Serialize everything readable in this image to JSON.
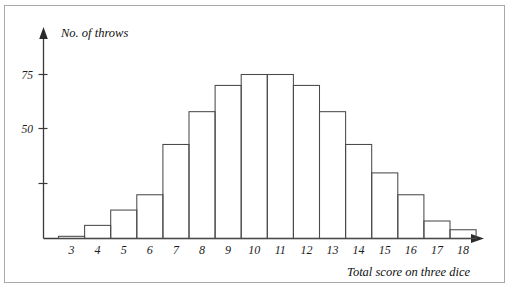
{
  "chart_data": {
    "type": "bar",
    "title": "",
    "ylabel": "No. of throws",
    "xlabel": "Total score on three dice",
    "categories": [
      "3",
      "4",
      "5",
      "6",
      "7",
      "8",
      "9",
      "10",
      "11",
      "12",
      "13",
      "14",
      "15",
      "16",
      "17",
      "18"
    ],
    "values": [
      1,
      6,
      13,
      20,
      43,
      58,
      70,
      75,
      75,
      70,
      58,
      43,
      30,
      20,
      8,
      4
    ],
    "ylim": [
      0,
      92
    ],
    "xlim": [
      2.5,
      18.5
    ],
    "y_ticks": [
      25,
      50,
      75
    ],
    "y_tick_labels": [
      "",
      "50",
      "75"
    ],
    "grid": false,
    "legend": false,
    "bar_style": "outline",
    "colors": {
      "bar_stroke": "#4a4a4a",
      "bar_fill": "none",
      "axis": "#3a3a3a",
      "text": "#1c1c1c",
      "frame": "#a8a8a8",
      "background": "#ffffff"
    }
  },
  "axes": {
    "y_axis_name": "No. of throws",
    "x_axis_name": "Total score on three dice",
    "y_label_75": "75",
    "y_label_50": "50"
  },
  "x_labels": {
    "l3": "3",
    "l4": "4",
    "l5": "5",
    "l6": "6",
    "l7": "7",
    "l8": "8",
    "l9": "9",
    "l10": "10",
    "l11": "11",
    "l12": "12",
    "l13": "13",
    "l14": "14",
    "l15": "15",
    "l16": "16",
    "l17": "17",
    "l18": "18"
  }
}
